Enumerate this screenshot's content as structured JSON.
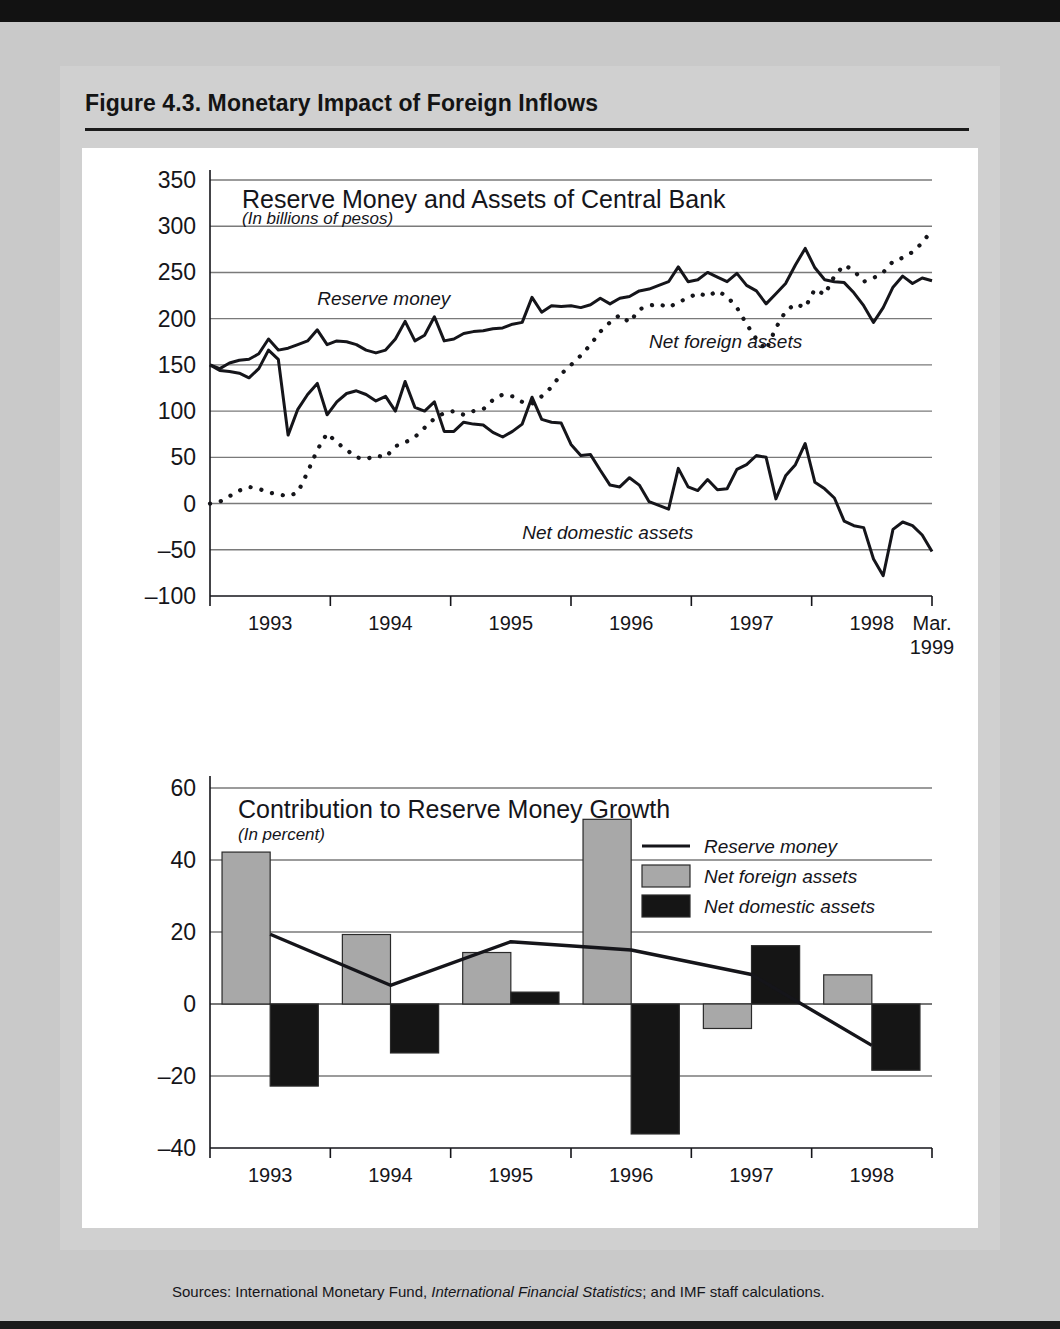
{
  "figure": {
    "title": "Figure 4.3.  Monetary Impact of Foreign Inflows",
    "sources_prefix": "Sources:  International Monetary Fund, ",
    "sources_italic": "International Financial Statistics",
    "sources_suffix": "; and IMF staff calculations."
  },
  "colors": {
    "page_background": "#c9c9c9",
    "figure_background": "#d0d0d0",
    "plot_background": "#ffffff",
    "ink": "#15151a",
    "gridline": "#7a7a7a",
    "net_foreign_assets_fill": "#a8a8a8",
    "net_domestic_assets_fill": "#151515"
  },
  "chart_data": [
    {
      "id": "reserve-money-and-assets",
      "type": "line",
      "title": "Reserve Money and Assets of Central Bank",
      "subtitle": "(In billions of pesos)",
      "xlabel": "",
      "ylabel": "",
      "ylim": [
        -100,
        350
      ],
      "yticks": [
        -100,
        -50,
        0,
        50,
        100,
        150,
        200,
        250,
        300,
        350
      ],
      "ytick_labels": [
        "–100",
        "–50",
        "0",
        "50",
        "100",
        "150",
        "200",
        "250",
        "300",
        "350"
      ],
      "xticks": [
        "1993",
        "1994",
        "1995",
        "1996",
        "1997",
        "1998",
        "Mar.\n1999"
      ],
      "xtick_labels": [
        "1993",
        "1994",
        "1995",
        "1996",
        "1997",
        "1998",
        "Mar."
      ],
      "xtick_label_last_line2": "1999",
      "grid": true,
      "legend_position": "inline-annotations",
      "annotations": [
        {
          "text": "Reserve money",
          "x_index": 11,
          "value": 215
        },
        {
          "text": "Net foreign assets",
          "x_index": 45,
          "value": 168
        },
        {
          "text": "Net domestic assets",
          "x_index": 32,
          "value": -38
        }
      ],
      "x_start": "1993-01",
      "x_end": "1999-03",
      "n_points": 75,
      "series": [
        {
          "name": "Reserve money",
          "style": "solid",
          "values": [
            150,
            146,
            152,
            155,
            156,
            162,
            178,
            166,
            168,
            172,
            176,
            188,
            172,
            176,
            175,
            172,
            166,
            163,
            166,
            178,
            197,
            176,
            182,
            202,
            176,
            178,
            184,
            186,
            187,
            189,
            190,
            194,
            196,
            223,
            207,
            214,
            213,
            214,
            212,
            215,
            222,
            216,
            222,
            224,
            230,
            232,
            236,
            240,
            256,
            240,
            242,
            250,
            245,
            240,
            249,
            236,
            230,
            216,
            227,
            238,
            258,
            276,
            255,
            242,
            240,
            239,
            228,
            214,
            196,
            212,
            234,
            246,
            238,
            244,
            241
          ]
        },
        {
          "name": "Net foreign assets",
          "style": "dotted",
          "values": [
            0,
            2,
            8,
            14,
            18,
            16,
            12,
            10,
            8,
            12,
            34,
            58,
            76,
            66,
            58,
            50,
            48,
            52,
            50,
            62,
            66,
            72,
            82,
            92,
            98,
            100,
            96,
            100,
            102,
            112,
            118,
            116,
            110,
            108,
            116,
            126,
            140,
            150,
            160,
            172,
            186,
            196,
            204,
            196,
            210,
            214,
            216,
            212,
            218,
            222,
            228,
            224,
            230,
            224,
            212,
            194,
            178,
            166,
            190,
            208,
            216,
            212,
            232,
            226,
            246,
            258,
            252,
            240,
            244,
            250,
            262,
            266,
            272,
            282,
            296
          ]
        },
        {
          "name": "Net domestic assets",
          "style": "solid",
          "values": [
            150,
            144,
            143,
            141,
            136,
            146,
            166,
            156,
            74,
            102,
            118,
            130,
            96,
            110,
            119,
            122,
            118,
            111,
            116,
            100,
            132,
            104,
            100,
            110,
            78,
            78,
            88,
            86,
            85,
            77,
            72,
            78,
            86,
            115,
            91,
            88,
            87,
            64,
            52,
            53,
            36,
            20,
            18,
            28,
            20,
            2,
            -2,
            -6,
            38,
            18,
            14,
            26,
            15,
            16,
            37,
            42,
            52,
            50,
            5,
            30,
            42,
            65,
            23,
            16,
            6,
            -19,
            -24,
            -26,
            -60,
            -78,
            -28,
            -20,
            -24,
            -34,
            -52
          ]
        }
      ]
    },
    {
      "id": "contribution-to-reserve-money-growth",
      "type": "bar",
      "title": "Contribution to Reserve Money Growth",
      "subtitle": "(In percent)",
      "xlabel": "",
      "ylabel": "",
      "ylim": [
        -40,
        60
      ],
      "yticks": [
        -40,
        -20,
        0,
        20,
        40,
        60
      ],
      "ytick_labels": [
        "–40",
        "–20",
        "0",
        "20",
        "40",
        "60"
      ],
      "categories": [
        "1993",
        "1994",
        "1995",
        "1996",
        "1997",
        "1998"
      ],
      "grid": true,
      "legend_position": "upper-right",
      "legend": [
        {
          "label": "Reserve money",
          "marker": "line"
        },
        {
          "label": "Net foreign assets",
          "marker": "swatch-gray"
        },
        {
          "label": "Net domestic assets",
          "marker": "swatch-black"
        }
      ],
      "series": [
        {
          "name": "Net foreign assets",
          "type": "bar",
          "values": [
            42.2,
            19.3,
            14.3,
            51.3,
            -6.8,
            8.1
          ]
        },
        {
          "name": "Net domestic assets",
          "type": "bar",
          "values": [
            -22.8,
            -13.6,
            3.3,
            -36.1,
            16.2,
            -18.4
          ]
        },
        {
          "name": "Reserve money",
          "type": "line",
          "values": [
            19.4,
            5.2,
            17.3,
            15.0,
            8.2,
            -11.5
          ]
        }
      ]
    }
  ]
}
